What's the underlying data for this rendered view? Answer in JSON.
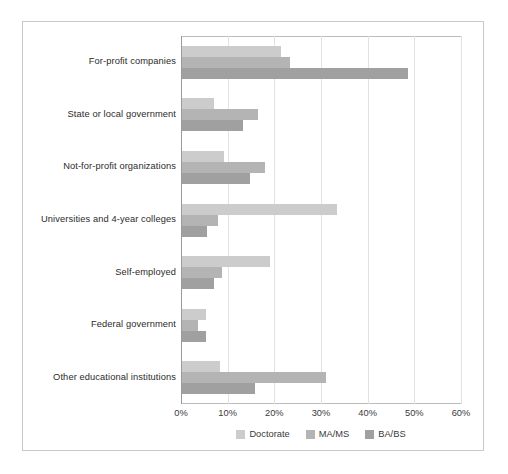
{
  "chart_data": {
    "type": "bar",
    "orientation": "horizontal",
    "title": "",
    "xlabel": "",
    "ylabel": "",
    "xlim": [
      0,
      60
    ],
    "xticks": [
      0,
      10,
      20,
      30,
      40,
      50,
      60
    ],
    "xtick_labels": [
      "0%",
      "10%",
      "20%",
      "30%",
      "40%",
      "50%",
      "60%"
    ],
    "grid": "vertical",
    "legend_position": "bottom-center",
    "categories": [
      "For-profit companies",
      "State or local government",
      "Not-for-profit organizations",
      "Universities and 4-year colleges",
      "Self-employed",
      "Federal government",
      "Other educational institutions"
    ],
    "series": [
      {
        "name": "Doctorate",
        "color": "#cccccc",
        "values": [
          21.4,
          7.0,
          9.2,
          33.4,
          19.0,
          5.4,
          8.4
        ]
      },
      {
        "name": "MA/MS",
        "color": "#b4b4b4",
        "values": [
          23.4,
          16.5,
          18.0,
          7.9,
          8.8,
          3.6,
          31.1
        ]
      },
      {
        "name": "BA/BS",
        "color": "#a0a0a0",
        "values": [
          48.6,
          13.3,
          14.8,
          5.6,
          7.0,
          5.4,
          15.9
        ]
      }
    ]
  },
  "legend": {
    "items": [
      {
        "label": "Doctorate",
        "color": "#cccccc"
      },
      {
        "label": "MA/MS",
        "color": "#b4b4b4"
      },
      {
        "label": "BA/BS",
        "color": "#a0a0a0"
      }
    ]
  },
  "colors": {
    "frame": "#c9c9c9",
    "gridline": "#e2e2e2",
    "axis": "#9a9a9a",
    "background": "#ffffff",
    "text": "#2b2b2b"
  }
}
